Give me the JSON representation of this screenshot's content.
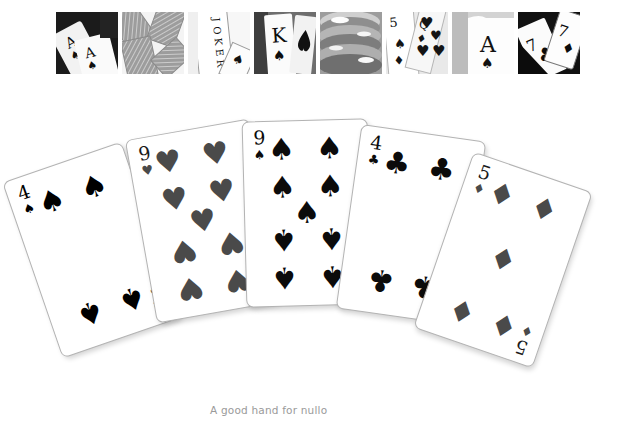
{
  "page": {
    "background_color": "#ffffff",
    "width": 622,
    "height": 448
  },
  "header_strip": {
    "name": "playing-card-photo-strip",
    "tile_count": 8,
    "tiles": [
      {
        "id": "tile-1",
        "icon": "photo-two-aces-icon",
        "alt": "Two ace of spades cards on dark background"
      },
      {
        "id": "tile-2",
        "icon": "photo-card-backs-icon",
        "alt": "Scattered patterned card backs"
      },
      {
        "id": "tile-3",
        "icon": "photo-joker-icon",
        "alt": "Joker card standing upright"
      },
      {
        "id": "tile-4",
        "icon": "photo-king-spades-icon",
        "alt": "King of spades held in hand"
      },
      {
        "id": "tile-5",
        "icon": "photo-poker-chips-icon",
        "alt": "Stack of poker chips close up"
      },
      {
        "id": "tile-6",
        "icon": "photo-five-hearts-icon",
        "alt": "Five of hearts and queen of diamonds fanned"
      },
      {
        "id": "tile-7",
        "icon": "photo-ace-spades-icon",
        "alt": "Ace of spades card on light background"
      },
      {
        "id": "tile-8",
        "icon": "photo-two-sevens-icon",
        "alt": "Seven of clubs and seven of diamonds"
      }
    ]
  },
  "card_fan": {
    "name": "fanned-poker-hand",
    "card_count": 5,
    "suit_glyphs": {
      "spades": "♠",
      "hearts": "♥",
      "clubs": "♣",
      "diamonds": "♦"
    },
    "colors": {
      "black_suit": "#0b0b0b",
      "gray_suit": "#4a4a4a",
      "card_face": "#ffffff",
      "card_border": "#b3b3b3"
    },
    "cards": [
      {
        "id": "card-1",
        "rank": "4",
        "suit": "spades",
        "suit_glyph": "♠",
        "label": "4 of Spades",
        "ink_color": "#0b0b0b",
        "rotation_deg": -19
      },
      {
        "id": "card-2",
        "rank": "9",
        "suit": "hearts",
        "suit_glyph": "♥",
        "label": "9 of Hearts",
        "ink_color": "#4a4a4a",
        "rotation_deg": -10
      },
      {
        "id": "card-3",
        "rank": "9",
        "suit": "spades",
        "suit_glyph": "♠",
        "label": "9 of Spades",
        "ink_color": "#0b0b0b",
        "rotation_deg": -1.5
      },
      {
        "id": "card-4",
        "rank": "4",
        "suit": "clubs",
        "suit_glyph": "♣",
        "label": "4 of Clubs",
        "ink_color": "#0b0b0b",
        "rotation_deg": 8
      },
      {
        "id": "card-5",
        "rank": "5",
        "suit": "diamonds",
        "suit_glyph": "♦",
        "label": "5 of Diamonds",
        "ink_color": "#4a4a4a",
        "rotation_deg": 19
      }
    ]
  },
  "caption": {
    "text": "A good hand for nullo",
    "color": "#9a9a9a"
  }
}
